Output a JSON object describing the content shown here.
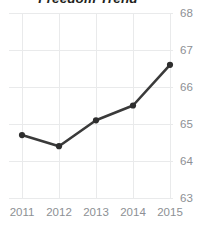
{
  "chart_data": {
    "type": "line",
    "title": "Freedom Trend",
    "xlabel": "",
    "ylabel": "",
    "categories": [
      "2011",
      "2012",
      "2013",
      "2014",
      "2015"
    ],
    "values": [
      64.7,
      64.4,
      65.1,
      65.5,
      66.6
    ],
    "series": [
      {
        "name": "Freedom Score",
        "values": [
          64.7,
          64.4,
          65.1,
          65.5,
          66.6
        ]
      }
    ],
    "x": [
      2011,
      2012,
      2013,
      2014,
      2015
    ],
    "ylim": [
      63,
      68
    ],
    "xlim": [
      2011,
      2015
    ],
    "y_ticks": [
      "68",
      "67",
      "66",
      "65",
      "64",
      "63"
    ],
    "y_tick_values": [
      68,
      67,
      66,
      65,
      64,
      63
    ],
    "x_ticks": [
      "2011",
      "2012",
      "2013",
      "2014",
      "2015"
    ],
    "grid": true,
    "legend": false,
    "legend_position": "none",
    "y_axis_position": "right",
    "marker": "circle",
    "colors": {
      "line": "#3a3a3a",
      "marker": "#2e2e2e",
      "grid": "#e9eaeb",
      "tick_label": "#8d9094",
      "title": "#231f20",
      "background": "#ffffff"
    }
  }
}
